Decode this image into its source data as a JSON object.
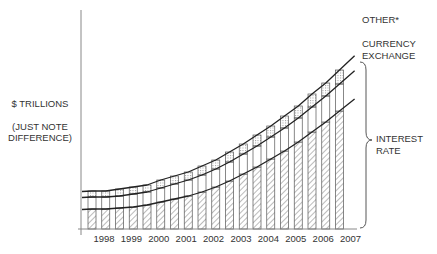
{
  "chart_data": {
    "type": "bar",
    "stacked": true,
    "title": "",
    "xlabel": "",
    "ylabel": "$ TRILLIONS",
    "ylabel_note": "(JUST NOTE DIFFERENCE)",
    "y_ticks": "none",
    "grid": false,
    "bars_per_year": 2,
    "year_labels": [
      "1998",
      "1999",
      "2000",
      "2001",
      "2002",
      "2003",
      "2004",
      "2005",
      "2006",
      "2007"
    ],
    "series": [
      {
        "name": "INTEREST RATE",
        "fill": "diagonal-hatch",
        "values": [
          20,
          20,
          21,
          22,
          24,
          27,
          30,
          33,
          37,
          42,
          48,
          55,
          62,
          70,
          78,
          87,
          97,
          107,
          118
        ]
      },
      {
        "name": "CURRENCY EXCHANGE",
        "fill": "white",
        "values": [
          12,
          12,
          12,
          13,
          13,
          14,
          15,
          16,
          17,
          18,
          19,
          20,
          21,
          22,
          23,
          24,
          25,
          26,
          27
        ]
      },
      {
        "name": "OTHER*",
        "fill": "dotted",
        "values": [
          6,
          6,
          7,
          7,
          7,
          8,
          8,
          8,
          9,
          9,
          10,
          10,
          11,
          11,
          12,
          12,
          13,
          13,
          14
        ]
      }
    ],
    "curves": [
      {
        "name": "OTHER*",
        "label_position": "right"
      },
      {
        "name": "CURRENCY EXCHANGE",
        "label_position": "right"
      },
      {
        "name": "INTEREST RATE",
        "label_position": "right-brace"
      }
    ],
    "annotations": [
      "OTHER*",
      "CURRENCY EXCHANGE",
      "INTEREST RATE"
    ],
    "units_note": "relative values (no y-axis scale shown)"
  },
  "labels": {
    "y_title": "$ TRILLIONS",
    "y_note_1": "(JUST NOTE",
    "y_note_2": "DIFFERENCE)",
    "other": "OTHER*",
    "currency_1": "CURRENCY",
    "currency_2": "EXCHANGE",
    "interest_1": "INTEREST",
    "interest_2": "RATE"
  },
  "colors": {
    "line": "#222222",
    "bar_edge": "#555555",
    "hatch": "#777777",
    "axis": "#888888"
  }
}
